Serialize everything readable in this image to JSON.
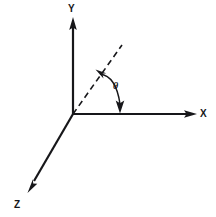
{
  "figure": {
    "background_color": "#ffffff",
    "stroke_color": "#17171a",
    "width": 216,
    "height": 217
  },
  "axes": {
    "origin": {
      "x": 73,
      "y": 114
    },
    "items": [
      {
        "id": "y-axis",
        "label": "Y",
        "direction": "up",
        "start": {
          "x": 73,
          "y": 114
        },
        "end": {
          "x": 73,
          "y": 18
        },
        "arrow": true,
        "dashed": false
      },
      {
        "id": "x-axis",
        "label": "X",
        "direction": "right",
        "start": {
          "x": 73,
          "y": 114
        },
        "end": {
          "x": 196,
          "y": 114
        },
        "arrow": true,
        "dashed": false
      },
      {
        "id": "z-axis",
        "label": "Z",
        "direction": "down-left",
        "start": {
          "x": 73,
          "y": 114
        },
        "end": {
          "x": 28,
          "y": 192
        },
        "arrow": true,
        "dashed": false
      }
    ]
  },
  "ray": {
    "id": "dashed-ray",
    "label": "",
    "dashed": true,
    "start": {
      "x": 73,
      "y": 114
    },
    "end": {
      "x": 122,
      "y": 45
    },
    "arrow": false
  },
  "angle": {
    "id": "theta-angle",
    "symbol": "θ",
    "measured_between": [
      "dashed-ray",
      "x-axis"
    ],
    "arc_double_headed": true,
    "label_position": {
      "x": 117,
      "y": 86
    }
  },
  "labels": {
    "y": "Y",
    "x": "X",
    "z": "Z",
    "theta": "θ"
  }
}
